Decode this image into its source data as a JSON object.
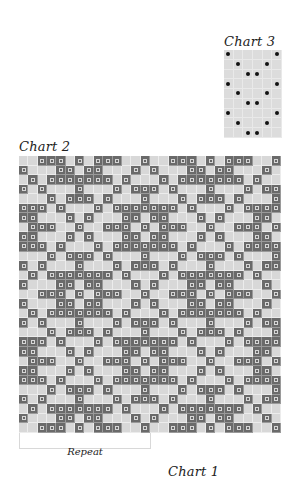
{
  "chart3": {
    "title": "Chart 3",
    "columns": 6,
    "rows": 9,
    "symbol": "dot",
    "dot_cells": [
      [
        0,
        5
      ],
      [
        1,
        4
      ],
      [
        2,
        3
      ],
      [
        0,
        5
      ],
      [
        1,
        4
      ],
      [
        2,
        3
      ],
      [
        0,
        5
      ],
      [
        1,
        4
      ],
      [
        2,
        3
      ]
    ]
  },
  "chart2": {
    "title": "Chart 2",
    "columns": 28,
    "rows": 29,
    "repeat_width": 14,
    "symbol": "x-in-dark-square",
    "motif_rows": [
      [
        2,
        3,
        4,
        6,
        8,
        9,
        10,
        13
      ],
      [
        0,
        4,
        5,
        7,
        8,
        12
      ],
      [
        1,
        3,
        4,
        5,
        6,
        7,
        8,
        9,
        11
      ],
      [
        0,
        2,
        6,
        10,
        12,
        13
      ],
      [
        3,
        5,
        6,
        7,
        9,
        13
      ],
      [
        0,
        1,
        2,
        4,
        8,
        10,
        11,
        12,
        13
      ],
      [
        0,
        1,
        5,
        7,
        11,
        12
      ],
      [
        1,
        2,
        3,
        6,
        9,
        10,
        11,
        13
      ],
      [
        0,
        1,
        5,
        7,
        11,
        12
      ],
      [
        0,
        1,
        2,
        4,
        8,
        10,
        11,
        12,
        13
      ],
      [
        3,
        5,
        6,
        7,
        9,
        13
      ],
      [
        0,
        2,
        6,
        10,
        12,
        13
      ],
      [
        1,
        3,
        4,
        5,
        6,
        7,
        8,
        9,
        11
      ],
      [
        0,
        4,
        5,
        7,
        8,
        12
      ],
      [
        2,
        3,
        4,
        6,
        8,
        9,
        10,
        13
      ]
    ],
    "row_sequence_note": "rows 0-14 = motif_rows 0-14; rows 15-28 = motif_rows 1-14",
    "repeat_label": "Repeat"
  },
  "chart1": {
    "title": "Chart 1"
  },
  "colors": {
    "dark_cell": "#6a6a6a",
    "light_cell": "#d8d8d8",
    "dot": "#111111",
    "text": "#222222"
  }
}
